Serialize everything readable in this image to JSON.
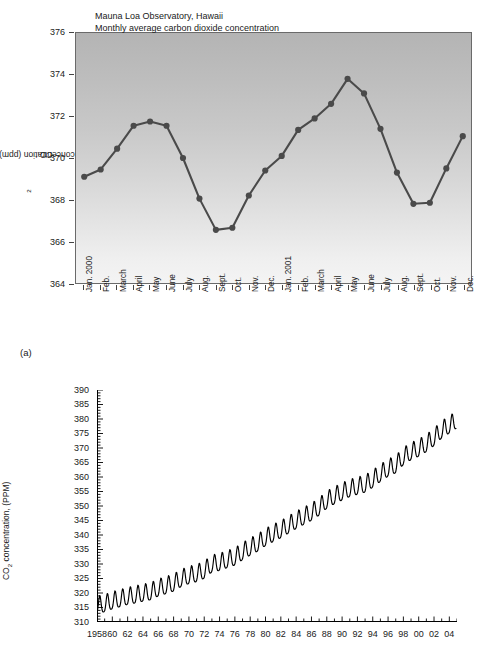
{
  "figure_a": {
    "panel_label": "(a)",
    "ylabel": "CO2 concentration (ppm)",
    "yticks": [
      364,
      366,
      368,
      370,
      372,
      374,
      376
    ],
    "xlabels": [
      "Jan. 2000",
      "Feb.",
      "March",
      "April",
      "May",
      "June",
      "July",
      "Aug.",
      "Sept.",
      "Oct.",
      "Nov.",
      "Dec.",
      "Jan. 2001",
      "Feb.",
      "March",
      "April",
      "May",
      "June",
      "July",
      "Aug.",
      "Sept.",
      "Oct.",
      "Nov.",
      "Dec."
    ],
    "line_color": "#4a4a4a",
    "plot_bg_top": "#b4b4b4",
    "plot_bg_bottom": "#f4f4f4"
  },
  "figure_b": {
    "title_line1": "Mauna Loa Observatory, Hawaii",
    "title_line2": "Monthly average carbon dioxide concentration",
    "ylabel": "CO2 concentration, (PPM)",
    "yticks": [
      310,
      315,
      320,
      325,
      330,
      335,
      340,
      345,
      350,
      355,
      360,
      365,
      370,
      375,
      380,
      385,
      390
    ],
    "xlabels": [
      "1958",
      "60",
      "62",
      "64",
      "66",
      "68",
      "70",
      "72",
      "74",
      "76",
      "78",
      "80",
      "82",
      "84",
      "86",
      "88",
      "90",
      "92",
      "94",
      "96",
      "98",
      "00",
      "02",
      "04"
    ],
    "line_color": "#000000"
  },
  "chart_data": [
    {
      "id": "figure-a",
      "type": "line",
      "title": "",
      "xlabel": "",
      "ylabel": "CO2 concentration (ppm)",
      "ylim": [
        364,
        376
      ],
      "grid": false,
      "legend": "none",
      "categories": [
        "Jan. 2000",
        "Feb.",
        "March",
        "April",
        "May",
        "June",
        "July",
        "Aug.",
        "Sept.",
        "Oct.",
        "Nov.",
        "Dec.",
        "Jan. 2001",
        "Feb.",
        "March",
        "April",
        "May",
        "June",
        "July",
        "Aug.",
        "Sept.",
        "Oct.",
        "Nov.",
        "Dec."
      ],
      "values": [
        369.1,
        369.45,
        370.45,
        371.55,
        371.75,
        371.55,
        370.0,
        368.05,
        366.55,
        366.65,
        368.2,
        369.4,
        370.1,
        371.35,
        371.9,
        372.6,
        373.8,
        373.1,
        371.4,
        369.3,
        367.8,
        367.85,
        369.5,
        371.05
      ]
    },
    {
      "id": "figure-b",
      "type": "line",
      "title": "Mauna Loa Observatory, Hawaii / Monthly average carbon dioxide concentration",
      "xlabel": "",
      "ylabel": "CO2 concentration, (PPM)",
      "ylim": [
        310,
        390
      ],
      "xlim": [
        1958,
        2005
      ],
      "grid": false,
      "legend": "none",
      "x_tick_years": [
        1958,
        1960,
        1962,
        1964,
        1966,
        1968,
        1970,
        1972,
        1974,
        1976,
        1978,
        1980,
        1982,
        1984,
        1986,
        1988,
        1990,
        1992,
        1994,
        1996,
        1998,
        2000,
        2002,
        2004
      ],
      "annual_mean_by_year": {
        "1958": 315.3,
        "1959": 315.9,
        "1960": 316.9,
        "1961": 317.6,
        "1962": 318.4,
        "1963": 318.9,
        "1964": 319.5,
        "1965": 320.0,
        "1966": 321.3,
        "1967": 322.1,
        "1968": 323.0,
        "1969": 324.6,
        "1970": 325.6,
        "1971": 326.3,
        "1972": 327.4,
        "1973": 329.6,
        "1974": 330.1,
        "1975": 331.1,
        "1976": 332.0,
        "1977": 333.8,
        "1978": 335.4,
        "1979": 336.8,
        "1980": 338.7,
        "1981": 340.1,
        "1982": 341.4,
        "1983": 343.0,
        "1984": 344.6,
        "1985": 346.0,
        "1986": 347.4,
        "1987": 349.2,
        "1988": 351.6,
        "1989": 353.1,
        "1990": 354.4,
        "1991": 355.6,
        "1992": 356.4,
        "1993": 357.1,
        "1994": 358.8,
        "1995": 360.8,
        "1996": 362.6,
        "1997": 363.8,
        "1998": 366.6,
        "1999": 368.3,
        "2000": 369.5,
        "2001": 371.1,
        "2002": 373.2,
        "2003": 375.8,
        "2004": 377.5
      },
      "seasonal_amplitude_ppm": 6.0,
      "seasonal_peak_month": "May",
      "seasonal_trough_month": "September",
      "description": "Rising sawtooth: monthly CO2 climbs from about 315 ppm in 1958 to about 378 ppm in 2004 with a ~6 ppm annual oscillation."
    }
  ]
}
